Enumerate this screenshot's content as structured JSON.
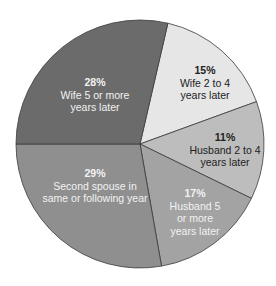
{
  "chart_data": {
    "type": "pie",
    "title": "",
    "start_angle_deg": 13,
    "direction": "clockwise",
    "slices": [
      {
        "label": "Wife 2 to 4 years later",
        "value": 15,
        "pct_label": "15%",
        "text": "Wife 2 to 4\nyears later",
        "color": "#e6e6e6",
        "text_color": "#222222",
        "angle_span": 57
      },
      {
        "label": "Husband 2 to 4 years later",
        "value": 11,
        "pct_label": "11%",
        "text": "Husband 2 to 4\nyears later",
        "color": "#bdbdbd",
        "text_color": "#222222",
        "angle_span": 46
      },
      {
        "label": "Husband 5 or more years later",
        "value": 17,
        "pct_label": "17%",
        "text": "Husband 5\nor more\nyears later",
        "color": "#a3a3a3",
        "text_color": "#f2f2f2",
        "angle_span": 54
      },
      {
        "label": "Second spouse in same or following year",
        "value": 29,
        "pct_label": "29%",
        "text": "Second spouse in\nsame or following year",
        "color": "#8f8f8f",
        "text_color": "#f2f2f2",
        "angle_span": 100
      },
      {
        "label": "Wife 5 or more years later",
        "value": 28,
        "pct_label": "28%",
        "text": "Wife 5 or more\nyears later",
        "color": "#6b6b6b",
        "text_color": "#f2f2f2",
        "angle_span": 103
      }
    ]
  }
}
